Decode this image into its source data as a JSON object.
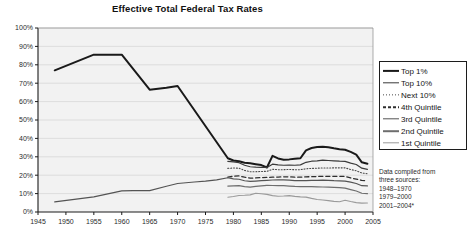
{
  "chart_data": {
    "type": "line",
    "title": "Effective Total Federal Tax Rates",
    "xlabel": "",
    "ylabel": "",
    "xlim": [
      1945,
      2005
    ],
    "ylim": [
      0,
      100
    ],
    "xticks": [
      1945,
      1950,
      1955,
      1960,
      1965,
      1970,
      1975,
      1980,
      1985,
      1990,
      1995,
      2000,
      2005
    ],
    "yticks": [
      0,
      10,
      20,
      30,
      40,
      50,
      60,
      70,
      80,
      90,
      100
    ],
    "ytick_labels": [
      "0%",
      "10%",
      "20%",
      "30%",
      "40%",
      "50%",
      "60%",
      "70%",
      "80%",
      "90%",
      "100%"
    ],
    "xtick_labels": [
      "1945",
      "1950",
      "1955",
      "1960",
      "1965",
      "1970",
      "1975",
      "1980",
      "1985",
      "1990",
      "1995",
      "2000",
      "2005"
    ],
    "grid": true,
    "legend_position": "right",
    "series": [
      {
        "name": "Top 1%",
        "style": "solid",
        "color": "#1a1a1a",
        "width": 2.0,
        "x": [
          1948,
          1955,
          1960,
          1965,
          1968,
          1970,
          1979,
          1980,
          1981,
          1982,
          1983,
          1984,
          1985,
          1986,
          1987,
          1988,
          1989,
          1990,
          1991,
          1992,
          1993,
          1994,
          1995,
          1996,
          1997,
          1998,
          1999,
          2000,
          2001,
          2002,
          2003,
          2004
        ],
        "y": [
          77.0,
          85.5,
          85.5,
          66.5,
          67.5,
          68.5,
          29.2,
          28.0,
          27.6,
          26.8,
          26.5,
          26.0,
          25.5,
          24.2,
          30.5,
          29.1,
          28.4,
          28.6,
          29.0,
          29.2,
          33.5,
          34.8,
          35.3,
          35.5,
          35.2,
          34.6,
          34.1,
          33.8,
          32.7,
          31.2,
          27.0,
          26.2
        ]
      },
      {
        "name": "Top 10%",
        "style": "solid",
        "color": "#3a3a3a",
        "width": 1.2,
        "x": [
          1979,
          1980,
          1981,
          1982,
          1983,
          1984,
          1985,
          1986,
          1987,
          1988,
          1989,
          1990,
          1991,
          1992,
          1993,
          1994,
          1995,
          1996,
          1997,
          1998,
          1999,
          2000,
          2001,
          2002,
          2003,
          2004
        ],
        "y": [
          27.5,
          27.2,
          26.8,
          25.4,
          24.6,
          24.4,
          24.3,
          24.2,
          26.0,
          25.6,
          25.4,
          25.5,
          25.4,
          25.6,
          27.0,
          27.6,
          27.8,
          28.2,
          28.0,
          27.8,
          27.6,
          27.5,
          26.6,
          25.8,
          23.8,
          23.2
        ]
      },
      {
        "name": "Next 10%",
        "style": "dotted",
        "color": "#4a4a4a",
        "width": 1.1,
        "x": [
          1979,
          1980,
          1981,
          1982,
          1983,
          1984,
          1985,
          1986,
          1987,
          1988,
          1989,
          1990,
          1991,
          1992,
          1993,
          1994,
          1995,
          1996,
          1997,
          1998,
          1999,
          2000,
          2001,
          2002,
          2003,
          2004
        ],
        "y": [
          23.7,
          23.9,
          23.8,
          22.6,
          21.9,
          21.9,
          22.0,
          22.1,
          23.2,
          23.0,
          23.0,
          23.1,
          23.0,
          23.0,
          23.5,
          23.7,
          23.8,
          23.9,
          23.9,
          24.0,
          24.0,
          24.0,
          23.1,
          22.4,
          21.2,
          20.8
        ]
      },
      {
        "name": "4th Quintile",
        "style": "dashed",
        "color": "#2e2e2e",
        "width": 1.3,
        "x": [
          1979,
          1980,
          1981,
          1982,
          1983,
          1984,
          1985,
          1986,
          1987,
          1988,
          1989,
          1990,
          1991,
          1992,
          1993,
          1994,
          1995,
          1996,
          1997,
          1998,
          1999,
          2000,
          2001,
          2002,
          2003,
          2004
        ],
        "y": [
          19.0,
          19.4,
          19.6,
          18.9,
          18.4,
          18.5,
          18.7,
          18.8,
          18.9,
          19.0,
          19.1,
          19.1,
          18.9,
          18.9,
          19.1,
          19.2,
          19.3,
          19.4,
          19.4,
          19.4,
          19.4,
          19.3,
          18.5,
          17.9,
          17.2,
          17.0
        ]
      },
      {
        "name": "3rd Quintile",
        "style": "solid",
        "color": "#545454",
        "width": 1.2,
        "x": [
          1948,
          1955,
          1960,
          1962,
          1965,
          1968,
          1970,
          1973,
          1975,
          1977,
          1979,
          1980,
          1981,
          1982,
          1983,
          1984,
          1985,
          1986,
          1987,
          1988,
          1989,
          1990,
          1991,
          1992,
          1993,
          1994,
          1995,
          1996,
          1997,
          1998,
          1999,
          2000,
          2001,
          2002,
          2003,
          2004
        ],
        "y": [
          5.5,
          8.2,
          11.5,
          11.6,
          11.6,
          14.0,
          15.5,
          16.3,
          16.8,
          17.5,
          18.6,
          18.0,
          17.8,
          17.0,
          16.6,
          16.8,
          17.0,
          17.2,
          17.4,
          17.5,
          17.5,
          17.3,
          17.1,
          17.0,
          17.1,
          17.2,
          17.2,
          17.3,
          17.2,
          17.0,
          16.9,
          16.8,
          16.2,
          15.5,
          14.3,
          14.2
        ]
      },
      {
        "name": "2nd Quintile",
        "style": "solid",
        "color": "#6e6e6e",
        "width": 1.2,
        "x": [
          1979,
          1980,
          1981,
          1982,
          1983,
          1984,
          1985,
          1986,
          1987,
          1988,
          1989,
          1990,
          1991,
          1992,
          1993,
          1994,
          1995,
          1996,
          1997,
          1998,
          1999,
          2000,
          2001,
          2002,
          2003,
          2004
        ],
        "y": [
          14.1,
          14.2,
          14.3,
          13.8,
          13.5,
          13.9,
          14.2,
          14.5,
          14.4,
          14.3,
          14.3,
          14.1,
          13.9,
          13.8,
          13.8,
          13.8,
          13.7,
          13.6,
          13.5,
          13.4,
          13.3,
          13.0,
          12.2,
          11.4,
          10.2,
          10.0
        ]
      },
      {
        "name": "1st Quintile",
        "style": "solid",
        "color": "#9a9a9a",
        "width": 1.1,
        "x": [
          1979,
          1980,
          1981,
          1982,
          1983,
          1984,
          1985,
          1986,
          1987,
          1988,
          1989,
          1990,
          1991,
          1992,
          1993,
          1994,
          1995,
          1996,
          1997,
          1998,
          1999,
          2000,
          2001,
          2002,
          2003,
          2004
        ],
        "y": [
          8.0,
          8.4,
          9.0,
          9.1,
          9.3,
          10.2,
          9.9,
          9.6,
          8.9,
          8.6,
          8.7,
          8.9,
          8.5,
          8.2,
          8.1,
          7.4,
          6.8,
          6.5,
          6.2,
          5.8,
          5.6,
          6.4,
          5.7,
          5.1,
          4.8,
          4.9
        ]
      }
    ],
    "legend": [
      {
        "label": "Top 1%",
        "style": "solid",
        "color": "#1a1a1a",
        "width": 2.2
      },
      {
        "label": "Top 10%",
        "style": "solid",
        "color": "#3a3a3a",
        "width": 1.4
      },
      {
        "label": "Next 10%",
        "style": "dotted",
        "color": "#4a4a4a",
        "width": 1.3
      },
      {
        "label": "4th Quintile",
        "style": "dashed",
        "color": "#2e2e2e",
        "width": 1.5
      },
      {
        "label": "3rd Quintile",
        "style": "solid",
        "color": "#545454",
        "width": 1.4
      },
      {
        "label": "2nd Quintile",
        "style": "solid",
        "color": "#6e6e6e",
        "width": 1.6
      },
      {
        "label": "1st Quintile",
        "style": "solid",
        "color": "#9a9a9a",
        "width": 1.4
      }
    ],
    "annotations": {
      "source_note": [
        "Data compiled from",
        "three sources:",
        "1948–1970",
        "1979–2000",
        "2001–2004*"
      ]
    }
  }
}
